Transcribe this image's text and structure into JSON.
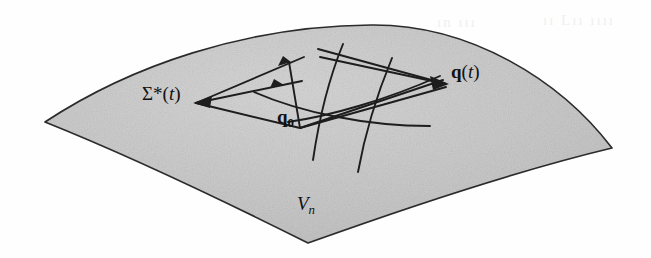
{
  "figure": {
    "type": "mathematical-diagram",
    "background_color": "#fefefe",
    "surface": {
      "name": "manifold-surface",
      "fill_color": "#c9c9c9",
      "stroke_color": "#2b2b2b",
      "label": "V",
      "label_subscript": "n",
      "description": "shaded curvilinear quadrilateral patch representing an n-dimensional manifold"
    },
    "labels": {
      "sigma_star": {
        "symbol": "Σ",
        "superscript": "*",
        "argument": "t",
        "full": "Σ*(t)",
        "role": "reachable-set-label"
      },
      "q_t": {
        "symbol": "q",
        "argument": "t",
        "full": "q(t)",
        "role": "endpoint-state-label"
      },
      "q_zero": {
        "symbol": "q",
        "subscript": "0",
        "full": "q₀",
        "role": "initial-state-label"
      },
      "v_n": {
        "symbol": "V",
        "subscript": "n",
        "full": "Vₙ",
        "role": "manifold-name-label"
      }
    },
    "annotation_color": "#1d1d1d",
    "ghost_text": {
      "left": "ın ııı",
      "right": "ıı Lıı ıııı"
    },
    "elements": {
      "straight_rays_from_q0": 4,
      "curved_trajectories": 4,
      "arrowheads": 3
    }
  }
}
